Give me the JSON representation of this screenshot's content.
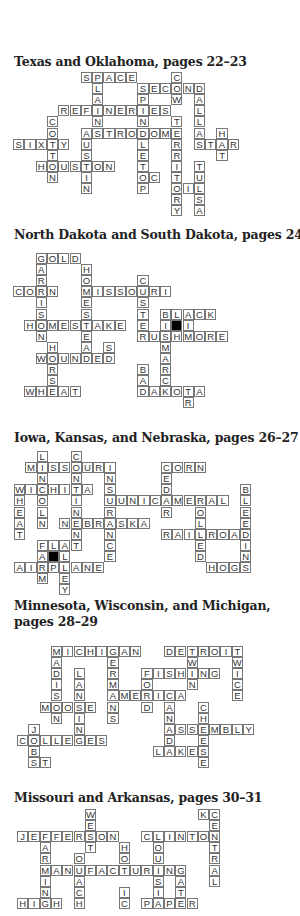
{
  "puzzles": [
    {
      "title": "Texas and Oklahoma, pages 22–23",
      "title_top": 54,
      "grid_left": 13,
      "grid_top": 72,
      "words": [
        {
          "word": "SPACE",
          "row": 0,
          "col": 6,
          "dir": "across"
        },
        {
          "word": "PLAINS",
          "row": 0,
          "col": 7,
          "dir": "down"
        },
        {
          "word": "COW",
          "row": 0,
          "col": 14,
          "dir": "down"
        },
        {
          "word": "SECOND",
          "row": 1,
          "col": 11,
          "dir": "across"
        },
        {
          "word": "SPINDLETOP",
          "row": 1,
          "col": 11,
          "dir": "down"
        },
        {
          "word": "DALLAS",
          "row": 1,
          "col": 16,
          "dir": "down"
        },
        {
          "word": "REFINERIES",
          "row": 3,
          "col": 4,
          "dir": "across"
        },
        {
          "word": "COTTON",
          "row": 4,
          "col": 3,
          "dir": "down"
        },
        {
          "word": "TERRITORY",
          "row": 4,
          "col": 14,
          "dir": "down"
        },
        {
          "word": "ASTRODOME",
          "row": 5,
          "col": 6,
          "dir": "across"
        },
        {
          "word": "AUSTIN",
          "row": 5,
          "col": 6,
          "dir": "down"
        },
        {
          "word": "HAT",
          "row": 5,
          "col": 18,
          "dir": "down"
        },
        {
          "word": "SIXTY",
          "row": 6,
          "col": 0,
          "dir": "across"
        },
        {
          "word": "STAR",
          "row": 6,
          "col": 16,
          "dir": "across"
        },
        {
          "word": "HOUSTON",
          "row": 8,
          "col": 2,
          "dir": "across"
        },
        {
          "word": "TULSA",
          "row": 8,
          "col": 16,
          "dir": "down"
        },
        {
          "word": "OC",
          "row": 9,
          "col": 11,
          "dir": "across"
        },
        {
          "word": "OIL",
          "row": 10,
          "col": 14,
          "dir": "across"
        }
      ],
      "blacks": []
    },
    {
      "title": "North Dakota and South Dakota, pages 24–25",
      "title_top": 227,
      "grid_left": 13,
      "grid_top": 253,
      "words": [
        {
          "word": "GOLD",
          "row": 0,
          "col": 2,
          "dir": "across"
        },
        {
          "word": "GARRISON",
          "row": 0,
          "col": 2,
          "dir": "down"
        },
        {
          "word": "HOMESTEAD",
          "row": 1,
          "col": 6,
          "dir": "down"
        },
        {
          "word": "CUSTER",
          "row": 2,
          "col": 11,
          "dir": "down"
        },
        {
          "word": "CORN",
          "row": 3,
          "col": 0,
          "dir": "across"
        },
        {
          "word": "MISSOURI",
          "row": 3,
          "col": 6,
          "dir": "across"
        },
        {
          "word": "BLACK",
          "row": 5,
          "col": 13,
          "dir": "across"
        },
        {
          "word": "BISMARCK",
          "row": 5,
          "col": 13,
          "dir": "down"
        },
        {
          "word": "HOMESTAKE",
          "row": 6,
          "col": 1,
          "dir": "across"
        },
        {
          "word": "I",
          "row": 6,
          "col": 15,
          "dir": "across"
        },
        {
          "word": "RUSHMORE",
          "row": 7,
          "col": 11,
          "dir": "across"
        },
        {
          "word": "HORSE",
          "row": 8,
          "col": 3,
          "dir": "down"
        },
        {
          "word": "SD",
          "row": 8,
          "col": 8,
          "dir": "down"
        },
        {
          "word": "WOUNDED",
          "row": 9,
          "col": 2,
          "dir": "across"
        },
        {
          "word": "BAD",
          "row": 10,
          "col": 11,
          "dir": "down"
        },
        {
          "word": "WHEAT",
          "row": 12,
          "col": 1,
          "dir": "across"
        },
        {
          "word": "DAKOTA",
          "row": 12,
          "col": 11,
          "dir": "across"
        },
        {
          "word": "TR",
          "row": 12,
          "col": 15,
          "dir": "down"
        }
      ],
      "blacks": [
        {
          "row": 6,
          "col": 14
        }
      ]
    },
    {
      "title": "Iowa, Kansas, and Nebraska, pages 26–27",
      "title_top": 430,
      "grid_left": 14,
      "grid_top": 451,
      "words": [
        {
          "word": "LINCOLN",
          "row": 0,
          "col": 2,
          "dir": "down"
        },
        {
          "word": "CONTINENT",
          "row": 0,
          "col": 5,
          "dir": "down"
        },
        {
          "word": "MISSOURI",
          "row": 1,
          "col": 1,
          "dir": "across"
        },
        {
          "word": "INSURANCE",
          "row": 1,
          "col": 8,
          "dir": "down"
        },
        {
          "word": "CORN",
          "row": 1,
          "col": 13,
          "dir": "across"
        },
        {
          "word": "CEDAR",
          "row": 1,
          "col": 13,
          "dir": "down"
        },
        {
          "word": "WICHITA",
          "row": 3,
          "col": 0,
          "dir": "across"
        },
        {
          "word": "WHEAT",
          "row": 3,
          "col": 0,
          "dir": "down"
        },
        {
          "word": "BLEEDING",
          "row": 3,
          "col": 20,
          "dir": "down"
        },
        {
          "word": "UNICAMERAL",
          "row": 4,
          "col": 9,
          "dir": "across"
        },
        {
          "word": "ROLLED",
          "row": 4,
          "col": 16,
          "dir": "down"
        },
        {
          "word": "NEBRASKA",
          "row": 6,
          "col": 4,
          "dir": "across"
        },
        {
          "word": "RAILROAD",
          "row": 7,
          "col": 13,
          "dir": "across"
        },
        {
          "word": "FLAT",
          "row": 8,
          "col": 2,
          "dir": "across"
        },
        {
          "word": "FARM",
          "row": 8,
          "col": 2,
          "dir": "down"
        },
        {
          "word": "ALLEY",
          "row": 8,
          "col": 4,
          "dir": "down"
        },
        {
          "word": "AIRPLANE",
          "row": 10,
          "col": 0,
          "dir": "across"
        },
        {
          "word": "HOGS",
          "row": 10,
          "col": 17,
          "dir": "across"
        }
      ],
      "blacks": [
        {
          "row": 9,
          "col": 3
        }
      ]
    },
    {
      "title": "Minnesota, Wisconsin, and Michigan,",
      "title_line2": "pages 28–29",
      "title_top": 598,
      "grid_left": 17,
      "grid_top": 646,
      "words": [
        {
          "word": "MICHIGAN",
          "row": 0,
          "col": 3,
          "dir": "across"
        },
        {
          "word": "MADISON",
          "row": 0,
          "col": 3,
          "dir": "down"
        },
        {
          "word": "GERMANS",
          "row": 0,
          "col": 8,
          "dir": "down"
        },
        {
          "word": "DETROIT",
          "row": 0,
          "col": 13,
          "dir": "across"
        },
        {
          "word": "TWIN",
          "row": 0,
          "col": 15,
          "dir": "down"
        },
        {
          "word": "TWICE",
          "row": 0,
          "col": 19,
          "dir": "down"
        },
        {
          "word": "LANSING",
          "row": 2,
          "col": 5,
          "dir": "down"
        },
        {
          "word": "FISHING",
          "row": 2,
          "col": 11,
          "dir": "across"
        },
        {
          "word": "FORD",
          "row": 2,
          "col": 11,
          "dir": "down"
        },
        {
          "word": "AMERICA",
          "row": 4,
          "col": 8,
          "dir": "across"
        },
        {
          "word": "CANADA",
          "row": 4,
          "col": 13,
          "dir": "down"
        },
        {
          "word": "MOOSE",
          "row": 5,
          "col": 2,
          "dir": "across"
        },
        {
          "word": "CHEESE",
          "row": 5,
          "col": 16,
          "dir": "down"
        },
        {
          "word": "JOBS",
          "row": 7,
          "col": 1,
          "dir": "down"
        },
        {
          "word": "ASSEMBLY",
          "row": 7,
          "col": 13,
          "dir": "across"
        },
        {
          "word": "COLLEGES",
          "row": 8,
          "col": 0,
          "dir": "across"
        },
        {
          "word": "LAKES",
          "row": 9,
          "col": 12,
          "dir": "across"
        },
        {
          "word": "ST",
          "row": 10,
          "col": 1,
          "dir": "across"
        }
      ],
      "blacks": []
    },
    {
      "title": "Missouri and Arkansas, pages 30–31",
      "title_top": 790,
      "grid_left": 17,
      "grid_top": 809,
      "words": [
        {
          "word": "WEST",
          "row": 0,
          "col": 6,
          "dir": "down"
        },
        {
          "word": "KC",
          "row": 0,
          "col": 16,
          "dir": "across"
        },
        {
          "word": "CENTRAL",
          "row": 0,
          "col": 17,
          "dir": "down"
        },
        {
          "word": "JEFFERSON",
          "row": 2,
          "col": 0,
          "dir": "across"
        },
        {
          "word": "FARMING",
          "row": 2,
          "col": 2,
          "dir": "down"
        },
        {
          "word": "CLINTON",
          "row": 2,
          "col": 11,
          "dir": "across"
        },
        {
          "word": "LOUISIA",
          "row": 2,
          "col": 12,
          "dir": "down"
        },
        {
          "word": "HOT",
          "row": 3,
          "col": 9,
          "dir": "down"
        },
        {
          "word": "OUACH",
          "row": 4,
          "col": 5,
          "dir": "down"
        },
        {
          "word": "MANUFACTURING",
          "row": 5,
          "col": 2,
          "dir": "across"
        },
        {
          "word": "GAT",
          "row": 5,
          "col": 14,
          "dir": "down"
        },
        {
          "word": "IC",
          "row": 7,
          "col": 9,
          "dir": "down"
        },
        {
          "word": "HIGH",
          "row": 8,
          "col": 0,
          "dir": "across"
        },
        {
          "word": "PAPER",
          "row": 8,
          "col": 11,
          "dir": "across"
        }
      ],
      "blacks": []
    }
  ]
}
